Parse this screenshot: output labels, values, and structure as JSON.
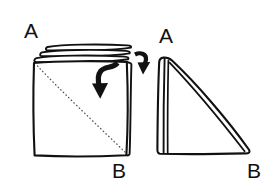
{
  "figure": {
    "type": "hand-drawn instructional diagram",
    "background_color": "#ffffff",
    "ink_color": "#111111",
    "fold_line_color": "#555555",
    "canvas": {
      "width": 275,
      "height": 192
    }
  },
  "left_figure": {
    "name": "stacked-folded-square",
    "description": "Square stack of folded sheets seen from above with layered top edges",
    "labels": {
      "top_corner": "A",
      "bottom_corner": "B"
    },
    "fold_line": {
      "style": "dotted",
      "from": "A (top-left)",
      "to": "B (bottom-right)"
    },
    "layer_count": 3
  },
  "right_figure": {
    "name": "folded-triangle",
    "description": "Resulting right triangle after folding corner A down to corner B",
    "labels": {
      "top_corner": "A",
      "bottom_corner": "B"
    }
  },
  "arrows": {
    "fold_arrow": {
      "name": "fold-direction-arrow",
      "description": "Curved hook arrow inside the square pointing down-left indicating the fold direction"
    },
    "transition_arrow": {
      "name": "step-transition-arrow",
      "description": "Small hooked arrow between the two figures pointing down-right to the result"
    }
  }
}
